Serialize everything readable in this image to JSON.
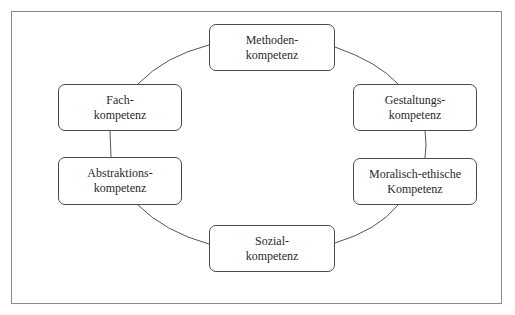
{
  "diagram": {
    "type": "cycle",
    "nodes": [
      {
        "id": "methoden",
        "line1": "Methoden-",
        "line2": "kompetenz"
      },
      {
        "id": "gestaltung",
        "line1": "Gestaltungs-",
        "line2": "kompetenz"
      },
      {
        "id": "moralisch",
        "line1": "Moralisch-ethische",
        "line2": "Kompetenz"
      },
      {
        "id": "sozial",
        "line1": "Sozial-",
        "line2": "kompetenz"
      },
      {
        "id": "abstraktion",
        "line1": "Abstraktions-",
        "line2": "kompetenz"
      },
      {
        "id": "fach",
        "line1": "Fach-",
        "line2": "kompetenz"
      }
    ],
    "edges": [
      [
        "methoden",
        "gestaltung"
      ],
      [
        "gestaltung",
        "moralisch"
      ],
      [
        "moralisch",
        "sozial"
      ],
      [
        "sozial",
        "abstraktion"
      ],
      [
        "abstraktion",
        "fach"
      ],
      [
        "fach",
        "methoden"
      ]
    ],
    "colors": {
      "border": "#4a4a4a",
      "frame": "#8a8a8a",
      "text": "#2a2a2a",
      "background": "#ffffff"
    }
  }
}
